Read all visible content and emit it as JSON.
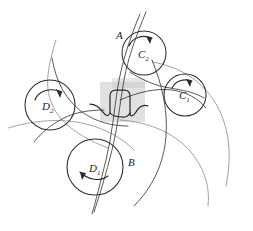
{
  "figure": {
    "kind": "gear-tooth-contact-diagram",
    "background_color": "#ffffff",
    "ink_color": "#2b2b2b",
    "faint_ink_color": "#8a8a8a",
    "shade_color": "#c9c9c9",
    "shade_opacity": "0.55",
    "width": 253,
    "height": 231
  },
  "labels": {
    "curve_a": "A",
    "curve_b": "B",
    "circle_c1_base": "C",
    "circle_c1_sub": "1",
    "circle_c2_base": "C",
    "circle_c2_sub": "2",
    "circle_d1_base": "D",
    "circle_d1_sub": "1",
    "circle_d2_base": "D",
    "circle_d2_sub": "2"
  },
  "circles": [
    {
      "name": "C2",
      "label_base": "C",
      "label_sub": "2",
      "cx": 144,
      "cy": 53,
      "r": 22,
      "rotation": "clockwise",
      "label_x": 142,
      "label_y": 57
    },
    {
      "name": "C1",
      "label_base": "C",
      "label_sub": "1",
      "cx": 185,
      "cy": 95,
      "r": 21,
      "rotation": "clockwise",
      "label_x": 182,
      "label_y": 98
    },
    {
      "name": "D2",
      "label_base": "D",
      "label_sub": "2",
      "cx": 50,
      "cy": 105,
      "r": 25,
      "rotation": "clockwise",
      "label_x": 46,
      "label_y": 110
    },
    {
      "name": "D1",
      "label_base": "D",
      "label_sub": "1",
      "cx": 95,
      "cy": 167,
      "r": 28,
      "rotation": "counterclockwise",
      "label_x": 93,
      "label_y": 172
    }
  ],
  "point_labels": [
    {
      "name": "A",
      "text": "A",
      "x": 119,
      "y": 39
    },
    {
      "name": "B",
      "text": "B",
      "x": 131,
      "y": 166
    }
  ],
  "shaded_region": {
    "x": 100,
    "y": 82,
    "width": 45,
    "height": 40,
    "color": "#c9c9c9"
  }
}
